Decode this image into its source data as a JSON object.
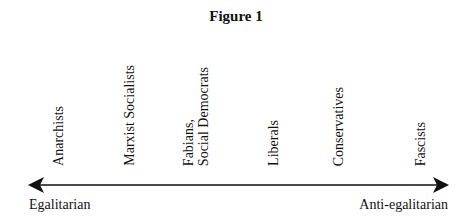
{
  "figure": {
    "title": "Figure 1",
    "axis": {
      "left_label": "Egalitarian",
      "right_label": "Anti-egalitarian",
      "line_color": "#111111"
    },
    "positions": [
      {
        "line1": "Anarchists",
        "line2": "",
        "x": 51
      },
      {
        "line1": "Marxist Socialists",
        "line2": "",
        "x": 122
      },
      {
        "line1": "Fabians,",
        "line2": "Social Democrats",
        "x": 181
      },
      {
        "line1": "Liberals",
        "line2": "",
        "x": 266
      },
      {
        "line1": "Conservatives",
        "line2": "",
        "x": 331
      },
      {
        "line1": "Fascists",
        "line2": "",
        "x": 413
      }
    ]
  }
}
